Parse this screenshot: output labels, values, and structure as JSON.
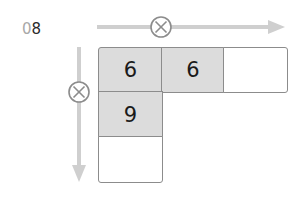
{
  "problem": {
    "number_prefix": "0",
    "number": "8"
  },
  "operator": {
    "symbol": "×",
    "horizontal_circle": "multiply-icon",
    "vertical_circle": "multiply-icon"
  },
  "grid": {
    "row1": [
      {
        "value": "6",
        "filled": true
      },
      {
        "value": "6",
        "filled": true
      },
      {
        "value": "",
        "filled": false
      }
    ],
    "col1": [
      {
        "value": "9",
        "filled": true
      },
      {
        "value": "",
        "filled": false
      }
    ]
  },
  "colors": {
    "arrow": "#cfcfcf",
    "cell_fill": "#dcdcdc",
    "border": "#8c8c8c"
  }
}
